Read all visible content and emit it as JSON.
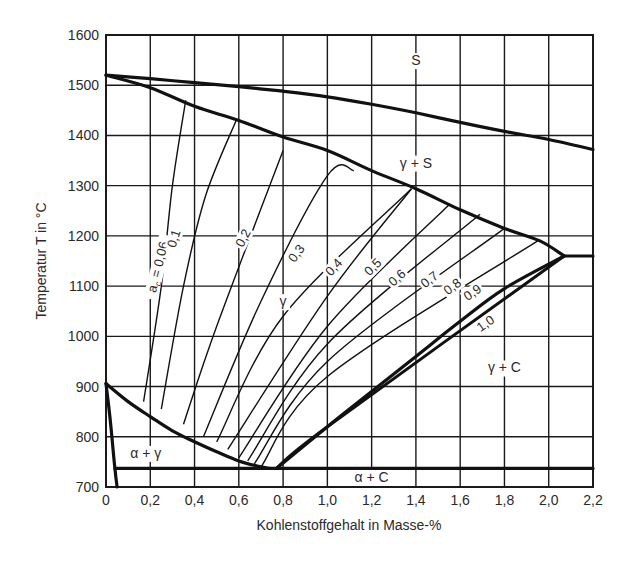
{
  "chart_data": {
    "type": "line",
    "title": "",
    "xlabel": "Kohlenstoffgehalt in Masse-%",
    "ylabel": "Temperatur T in °C",
    "xlim": [
      0,
      2.2
    ],
    "ylim": [
      700,
      1600
    ],
    "grid": true,
    "x_ticks": [
      0,
      0.2,
      0.4,
      0.6,
      0.8,
      1.0,
      1.2,
      1.4,
      1.6,
      1.8,
      2.0,
      2.2
    ],
    "x_tick_labels": [
      "0",
      "0,2",
      "0,4",
      "0,6",
      "0,8",
      "1,0",
      "1,2",
      "1,4",
      "1,6",
      "1,8",
      "2,0",
      "2,2"
    ],
    "y_ticks": [
      700,
      800,
      900,
      1000,
      1100,
      1200,
      1300,
      1400,
      1500,
      1600
    ],
    "y_tick_labels": [
      "700",
      "800",
      "900",
      "1000",
      "1100",
      "1200",
      "1300",
      "1400",
      "1500",
      "1600"
    ],
    "region_labels": [
      {
        "text": "S",
        "x": 1.4,
        "y": 1540
      },
      {
        "text": "γ + S",
        "x": 1.4,
        "y": 1336
      },
      {
        "text": "γ",
        "x": 0.8,
        "y": 1060
      },
      {
        "text": "γ + C",
        "x": 1.8,
        "y": 928
      },
      {
        "text": "α + γ",
        "x": 0.18,
        "y": 758
      },
      {
        "text": "α + C",
        "x": 1.2,
        "y": 710
      }
    ],
    "phase_boundaries": [
      {
        "name": "liquidus",
        "points": [
          [
            0,
            1520
          ],
          [
            0.2,
            1513
          ],
          [
            0.4,
            1505
          ],
          [
            0.6,
            1497
          ],
          [
            0.8,
            1488
          ],
          [
            1.0,
            1477
          ],
          [
            1.2,
            1462
          ],
          [
            1.4,
            1445
          ],
          [
            1.6,
            1426
          ],
          [
            1.8,
            1408
          ],
          [
            2.0,
            1392
          ],
          [
            2.2,
            1372
          ]
        ]
      },
      {
        "name": "solidus",
        "points": [
          [
            0,
            1520
          ],
          [
            0.2,
            1495
          ],
          [
            0.4,
            1458
          ],
          [
            0.6,
            1430
          ],
          [
            0.8,
            1397
          ],
          [
            1.0,
            1370
          ],
          [
            1.2,
            1330
          ],
          [
            1.4,
            1294
          ],
          [
            1.6,
            1252
          ],
          [
            1.8,
            1215
          ],
          [
            1.96,
            1190
          ],
          [
            2.07,
            1160
          ]
        ]
      },
      {
        "name": "eutectic",
        "points": [
          [
            2.07,
            1160
          ],
          [
            2.2,
            1160
          ]
        ]
      },
      {
        "name": "A3",
        "points": [
          [
            0,
            906
          ],
          [
            0.1,
            870
          ],
          [
            0.2,
            840
          ],
          [
            0.3,
            812
          ],
          [
            0.4,
            790
          ],
          [
            0.5,
            770
          ],
          [
            0.6,
            752
          ],
          [
            0.7,
            740
          ],
          [
            0.74,
            737
          ]
        ]
      },
      {
        "name": "Acm",
        "points": [
          [
            0.77,
            737
          ],
          [
            1.0,
            820
          ],
          [
            1.2,
            890
          ],
          [
            1.4,
            960
          ],
          [
            1.6,
            1030
          ],
          [
            1.8,
            1095
          ],
          [
            2.07,
            1160
          ]
        ]
      },
      {
        "name": "A1",
        "points": [
          [
            0.04,
            737
          ],
          [
            2.2,
            737
          ]
        ]
      },
      {
        "name": "ferrite-solvus",
        "points": [
          [
            0,
            906
          ],
          [
            0.02,
            830
          ],
          [
            0.04,
            737
          ],
          [
            0.05,
            700
          ]
        ]
      }
    ],
    "series": [
      {
        "name": "a_C = 0,06",
        "label": "a_c = 0,06",
        "points": [
          [
            0.17,
            870
          ],
          [
            0.25,
            1100
          ],
          [
            0.3,
            1300
          ],
          [
            0.36,
            1470
          ]
        ]
      },
      {
        "name": "0,1",
        "label": "0,1",
        "points": [
          [
            0.25,
            855
          ],
          [
            0.35,
            1100
          ],
          [
            0.45,
            1280
          ],
          [
            0.59,
            1432
          ]
        ]
      },
      {
        "name": "0,2",
        "label": "0,2",
        "points": [
          [
            0.35,
            825
          ],
          [
            0.5,
            1020
          ],
          [
            0.8,
            1370
          ]
        ]
      },
      {
        "name": "0,3",
        "label": "0,3",
        "points": [
          [
            0.44,
            800
          ],
          [
            0.7,
            1070
          ],
          [
            1.0,
            1320
          ],
          [
            1.12,
            1330
          ]
        ]
      },
      {
        "name": "0,4",
        "label": "0,4",
        "points": [
          [
            0.5,
            790
          ],
          [
            0.8,
            1040
          ],
          [
            1.38,
            1294
          ]
        ]
      },
      {
        "name": "0,5",
        "label": "0,5",
        "points": [
          [
            0.55,
            775
          ],
          [
            1.0,
            1080
          ],
          [
            1.38,
            1294
          ]
        ]
      },
      {
        "name": "0,6",
        "label": "0,6",
        "points": [
          [
            0.6,
            758
          ],
          [
            1.0,
            1020
          ],
          [
            1.55,
            1262
          ]
        ]
      },
      {
        "name": "0,7",
        "label": "0,7",
        "points": [
          [
            0.64,
            752
          ],
          [
            1.0,
            985
          ],
          [
            1.69,
            1243
          ]
        ]
      },
      {
        "name": "0,8",
        "label": "0,8",
        "points": [
          [
            0.67,
            746
          ],
          [
            1.0,
            950
          ],
          [
            1.8,
            1215
          ]
        ]
      },
      {
        "name": "0,9",
        "label": "0,9",
        "points": [
          [
            0.7,
            740
          ],
          [
            1.0,
            920
          ],
          [
            1.95,
            1190
          ]
        ]
      },
      {
        "name": "1,0",
        "label": "1,0",
        "thick": true,
        "points": [
          [
            0.77,
            737
          ],
          [
            1.0,
            820
          ],
          [
            2.07,
            1160
          ]
        ]
      }
    ]
  }
}
